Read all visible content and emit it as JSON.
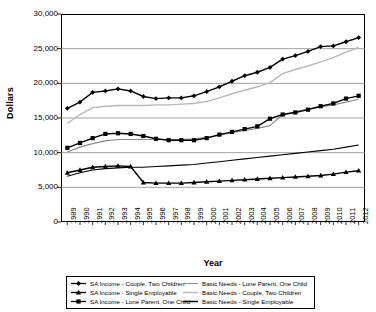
{
  "chart_data": {
    "type": "line",
    "title": "",
    "xlabel": "Year",
    "ylabel": "Dollars",
    "ylim": [
      0,
      30000
    ],
    "ytick_labels": [
      "30,000",
      "25,000",
      "20,000",
      "15,000",
      "10,000",
      "5,000",
      "0"
    ],
    "yticks": [
      30000,
      25000,
      20000,
      15000,
      10000,
      5000,
      0
    ],
    "grid": true,
    "grid_axis": "y",
    "legend_position": "below-plot",
    "categories": [
      "1989",
      "1990",
      "1991",
      "1992",
      "1993",
      "1994",
      "1995",
      "1996",
      "1997",
      "1998",
      "1999",
      "2000",
      "2001",
      "2002",
      "2003",
      "2004",
      "2005",
      "2006",
      "2007",
      "2008",
      "2009",
      "2010",
      "2011",
      "2012"
    ],
    "x": [
      1989,
      1990,
      1991,
      1992,
      1993,
      1994,
      1995,
      1996,
      1997,
      1998,
      1999,
      2000,
      2001,
      2002,
      2003,
      2004,
      2005,
      2006,
      2007,
      2008,
      2009,
      2010,
      2011,
      2012
    ],
    "series": [
      {
        "name": "SA Income - Couple, Two Children",
        "marker": "diamond",
        "style": "line-marker",
        "color": "#000000",
        "width": 1.4,
        "values": [
          16400,
          17300,
          18700,
          18900,
          19200,
          18900,
          18100,
          17800,
          17900,
          17900,
          18200,
          18800,
          19500,
          20300,
          21100,
          21600,
          22300,
          23500,
          24000,
          24600,
          25300,
          25400,
          26000,
          26600
        ]
      },
      {
        "name": "SA Income - Single Employable",
        "marker": "triangle",
        "style": "line-marker",
        "color": "#000000",
        "width": 1.4,
        "values": [
          7100,
          7500,
          7900,
          8000,
          8100,
          8000,
          5700,
          5600,
          5600,
          5600,
          5700,
          5800,
          5900,
          6000,
          6100,
          6200,
          6300,
          6400,
          6500,
          6600,
          6700,
          6900,
          7200,
          7400
        ]
      },
      {
        "name": "SA Income - Lone Parent, One Child",
        "marker": "square",
        "style": "line-marker",
        "color": "#000000",
        "width": 1.4,
        "values": [
          10700,
          11400,
          12100,
          12700,
          12800,
          12700,
          12400,
          12000,
          11800,
          11800,
          11800,
          12100,
          12600,
          13000,
          13400,
          13800,
          14900,
          15500,
          15800,
          16200,
          16700,
          17100,
          17800,
          18200
        ]
      },
      {
        "name": "Basic Needs - Lone Parent, One Child",
        "marker": "none",
        "style": "line-gray",
        "color": "#8c8c8c",
        "width": 1.2,
        "values": [
          10100,
          10800,
          11300,
          11700,
          11900,
          11900,
          11900,
          11900,
          11900,
          11900,
          12000,
          12200,
          12500,
          12900,
          13200,
          13500,
          13900,
          15500,
          15900,
          16300,
          16600,
          16900,
          17300,
          17700
        ]
      },
      {
        "name": "Basic Needs - Couple, Two Children",
        "marker": "none",
        "style": "line-lightgray",
        "color": "#b8b8b8",
        "width": 1.4,
        "values": [
          14200,
          15500,
          16500,
          16700,
          16800,
          16800,
          16800,
          16900,
          16900,
          17000,
          17100,
          17400,
          17900,
          18500,
          19000,
          19500,
          20100,
          21400,
          22000,
          22500,
          23100,
          23700,
          24500,
          25200
        ]
      },
      {
        "name": "Basic Needs - Single Employable",
        "marker": "none",
        "style": "line-dark-thin",
        "color": "#000000",
        "width": 1.1,
        "values": [
          6600,
          7100,
          7500,
          7700,
          7800,
          7900,
          7900,
          8000,
          8100,
          8200,
          8300,
          8500,
          8700,
          8900,
          9100,
          9300,
          9500,
          9700,
          9900,
          10100,
          10300,
          10500,
          10800,
          11100
        ]
      }
    ]
  },
  "axes": {
    "y_title": "Dollars",
    "x_title": "Year"
  },
  "legend": {
    "left_items": [
      {
        "label": "SA Income - Couple, Two Children",
        "swatch": "line-diamond-marker"
      },
      {
        "label": "SA Income - Single Employable",
        "swatch": "line-triangle-marker"
      },
      {
        "label": "SA Income - Lone Parent, One Child",
        "swatch": "line-square-marker"
      }
    ],
    "right_items": [
      {
        "label": "Basic Needs - Lone Parent, One Child",
        "swatch": "line-gray"
      },
      {
        "label": "Basic Needs - Couple, Two Children",
        "swatch": "line-lightgray"
      },
      {
        "label": "Basic Needs - Single Employable",
        "swatch": "line-dark-thin"
      }
    ]
  }
}
